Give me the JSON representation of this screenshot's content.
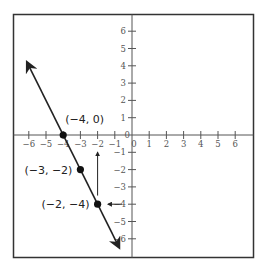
{
  "chart_data": {
    "type": "line",
    "title": "",
    "xlabel": "",
    "ylabel": "",
    "xlim": [
      -6.8,
      7
    ],
    "ylim": [
      -7,
      7
    ],
    "grid": false,
    "x_ticks": [
      -6,
      -5,
      -4,
      -3,
      -2,
      -1,
      0,
      1,
      2,
      3,
      4,
      5,
      6
    ],
    "y_ticks": [
      -6,
      -5,
      -4,
      -3,
      -2,
      -1,
      0,
      1,
      2,
      3,
      4,
      5,
      6
    ],
    "x_tick_labels": [
      "−6",
      "−5",
      "−4",
      "−3",
      "−2",
      "−1",
      "0",
      "1",
      "2",
      "3",
      "4",
      "5",
      "6"
    ],
    "y_tick_labels": [
      "−6",
      "−5",
      "−4",
      "−3",
      "−2",
      "−1",
      "0",
      "1",
      "2",
      "3",
      "4",
      "5",
      "6"
    ],
    "series": [
      {
        "name": "line",
        "equation": "y = -2x - 8",
        "slope": -2,
        "y_intercept": -8,
        "x_range": [
          -6.1,
          -0.75
        ],
        "arrows_both_ends": true
      }
    ],
    "points": [
      {
        "x": -4,
        "y": 0,
        "label": "(−4, 0)"
      },
      {
        "x": -3,
        "y": -2,
        "label": "(−3, −2)"
      },
      {
        "x": -2,
        "y": -4,
        "label": "(−2, −4)"
      }
    ],
    "annotations": [
      {
        "type": "arrow",
        "from": [
          -2,
          -3.5
        ],
        "to": [
          -2,
          -1
        ],
        "description": "vertical arrow pointing up at x = −2"
      },
      {
        "type": "arrow",
        "from": [
          -0.6,
          -4
        ],
        "to": [
          -1.4,
          -4
        ],
        "description": "short arrow pointing left at y = −4"
      }
    ],
    "colors": {
      "line": "#222222",
      "axes": "#555555",
      "frame": "#333333",
      "points": "#111111"
    }
  }
}
